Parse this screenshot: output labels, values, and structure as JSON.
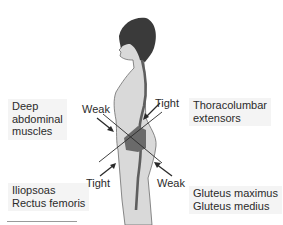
{
  "diagram": {
    "labels": {
      "deep_abdominal": {
        "line1": "Deep",
        "line2": "abdominal",
        "line3": "muscles"
      },
      "thoracolumbar": {
        "line1": "Thoracolumbar",
        "line2": "extensors"
      },
      "hip_flexors": {
        "line1": "Iliopsoas",
        "line2": "Rectus femoris"
      },
      "gluteals": {
        "line1": "Gluteus maximus",
        "line2": "Gluteus medius"
      }
    },
    "arrow_tags": {
      "upper_left": "Weak",
      "upper_right": "Tight",
      "lower_left": "Tight",
      "lower_right": "Weak"
    },
    "colors": {
      "skin": "#d9d9d9",
      "hair": "#3a3a3a",
      "spine": "#5e5e5e",
      "pelvis": "#6a6a6a",
      "lines": "#2a2a2a",
      "label_bg": "#f4f4f4"
    }
  }
}
